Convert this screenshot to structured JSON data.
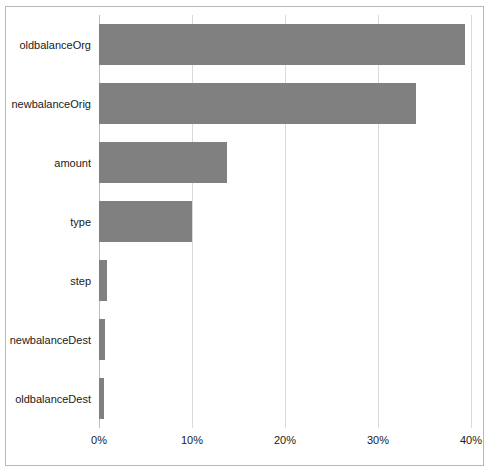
{
  "chart_data": {
    "type": "bar",
    "orientation": "horizontal",
    "title": "",
    "subtitle": "",
    "xlabel": "",
    "ylabel": "",
    "categories": [
      "oldbalanceOrg",
      "newbalanceOrig",
      "amount",
      "type",
      "step",
      "newbalanceDest",
      "oldbalanceDest"
    ],
    "values": [
      39.4,
      34.1,
      13.8,
      10.0,
      0.85,
      0.6,
      0.55
    ],
    "value_unit": "%",
    "xlim": [
      0,
      40
    ],
    "ylim": [
      0,
      7
    ],
    "xticks": [
      0,
      10,
      20,
      30,
      40
    ],
    "xtick_labels": [
      "0%",
      "10%",
      "20%",
      "30%",
      "40%"
    ],
    "grid": true,
    "grid_axis": "x",
    "legend": false,
    "legend_position": "none",
    "bar_color": "#808080",
    "gridline_color": "#d9d9d9",
    "frame_color": "#b8b8b8",
    "background_color": "#ffffff",
    "series": [
      {
        "name": "importance",
        "values": [
          39.4,
          34.1,
          13.8,
          10.0,
          0.85,
          0.6,
          0.55
        ]
      }
    ]
  }
}
